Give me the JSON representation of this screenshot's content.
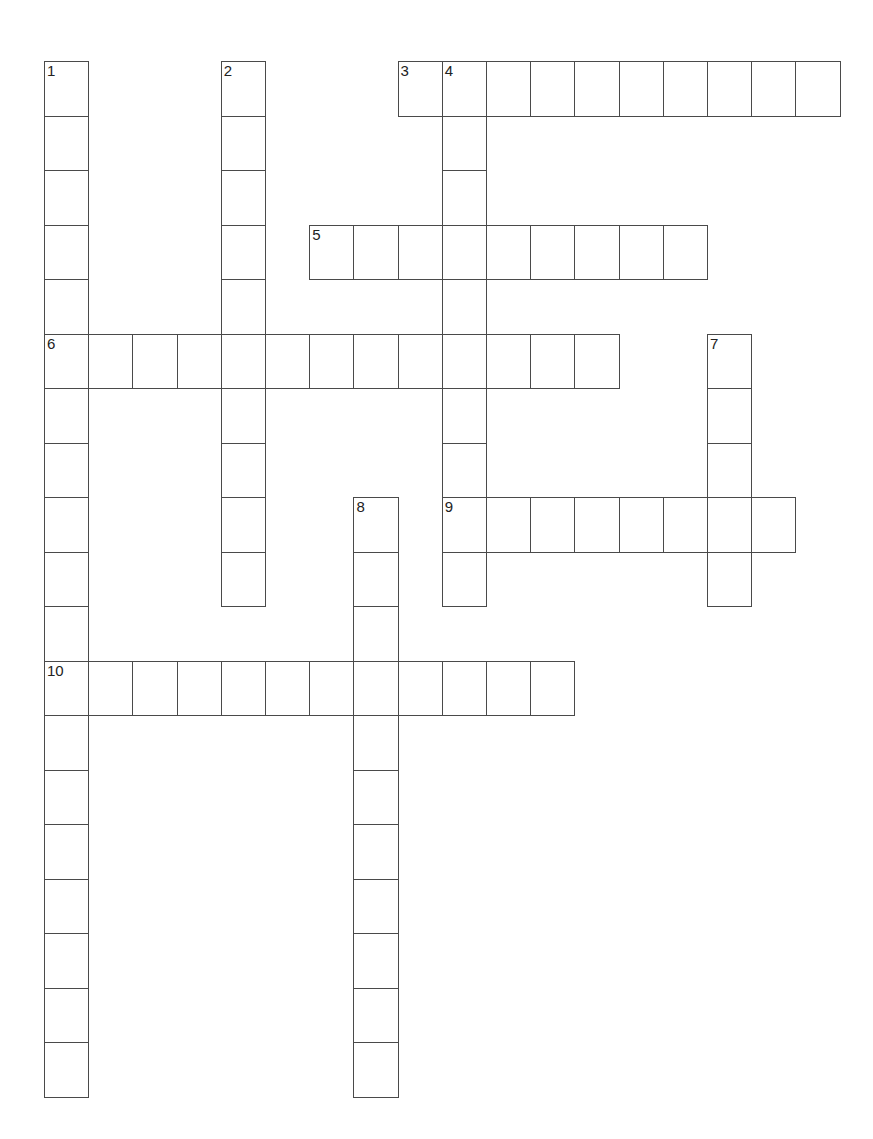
{
  "puzzle": {
    "grid_origin": {
      "x": 44,
      "y": 61
    },
    "cell_width": 44.2,
    "cell_height": 54.5,
    "line_color": "#4a4a4a",
    "entries": [
      {
        "number": "1",
        "direction": "down",
        "row": 0,
        "col": 0,
        "length": 19
      },
      {
        "number": "2",
        "direction": "down",
        "row": 0,
        "col": 4,
        "length": 10
      },
      {
        "number": "3",
        "direction": "across",
        "row": 0,
        "col": 8,
        "length": 10
      },
      {
        "number": "4",
        "direction": "down",
        "row": 0,
        "col": 9,
        "length": 10
      },
      {
        "number": "5",
        "direction": "across",
        "row": 3,
        "col": 6,
        "length": 9
      },
      {
        "number": "6",
        "direction": "across",
        "row": 5,
        "col": 0,
        "length": 13
      },
      {
        "number": "7",
        "direction": "down",
        "row": 5,
        "col": 15,
        "length": 5
      },
      {
        "number": "8",
        "direction": "down",
        "row": 8,
        "col": 7,
        "length": 11
      },
      {
        "number": "9",
        "direction": "across",
        "row": 8,
        "col": 9,
        "length": 8
      },
      {
        "number": "10",
        "direction": "across",
        "row": 11,
        "col": 0,
        "length": 12
      }
    ]
  }
}
